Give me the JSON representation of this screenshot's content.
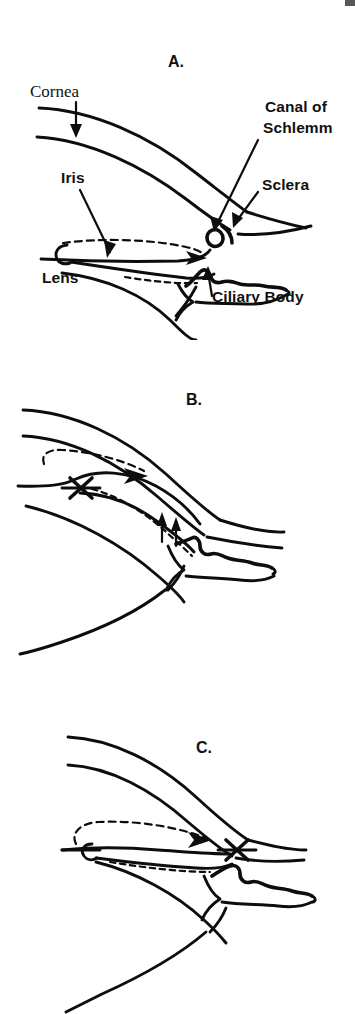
{
  "figure": {
    "background_color": "#ffffff",
    "ink_color": "#0d0d0d",
    "width": 355,
    "height": 1014
  },
  "panels": [
    {
      "id": "a",
      "letter": "A.",
      "letter_x": 168,
      "letter_y": 27,
      "caption": "Normal aqueous outflow",
      "labels": [
        {
          "name": "cornea",
          "text": "Cornea",
          "x": 30,
          "y": 57,
          "style": "serif"
        },
        {
          "name": "canal-of-schlemm-line1",
          "text": "Canal of",
          "x": 265,
          "y": 72,
          "style": "sans"
        },
        {
          "name": "canal-of-schlemm-line2",
          "text": "Schlemm",
          "x": 263,
          "y": 93,
          "style": "sans"
        },
        {
          "name": "sclera",
          "text": "Sclera",
          "x": 262,
          "y": 150,
          "style": "sans"
        },
        {
          "name": "iris",
          "text": "Iris",
          "x": 61,
          "y": 143,
          "style": "sans"
        },
        {
          "name": "lens",
          "text": "Lens",
          "x": 42,
          "y": 243,
          "style": "sans"
        },
        {
          "name": "ciliary-body",
          "text": "Ciliary Body",
          "x": 212,
          "y": 262,
          "style": "sans"
        }
      ]
    },
    {
      "id": "b",
      "letter": "B.",
      "letter_x": 186,
      "letter_y": 35,
      "caption": "Pupillary block with iris bombe",
      "labels": []
    },
    {
      "id": "c",
      "letter": "C.",
      "letter_x": 196,
      "letter_y": 73,
      "caption": "Angle closure",
      "labels": []
    }
  ],
  "annotations": {
    "block_marker": "X",
    "flow_line_style": "dashed",
    "flow_arrow_direction": "right"
  }
}
